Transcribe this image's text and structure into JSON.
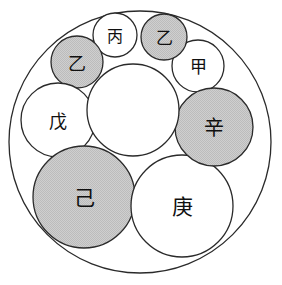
{
  "figure": {
    "kind": "circle-packing-diagram",
    "canvas": {
      "width": 282,
      "height": 285
    },
    "background_color": "#ffffff",
    "stroke_color": "#2a2a2a",
    "shaded_fill_color": "#c9c9c9",
    "unshaded_fill_color": "#ffffff",
    "stroke_width": 1.3
  },
  "outer_circle": {
    "name": "outer-boundary-circle",
    "cx": 140,
    "cy": 142,
    "r": 131,
    "fill": "#ffffff",
    "shaded": false,
    "label": ""
  },
  "central_circle": {
    "name": "central-circle",
    "cx": 133,
    "cy": 110,
    "r": 46,
    "fill": "#ffffff",
    "shaded": false,
    "label": ""
  },
  "chain_circles": [
    {
      "name": "circle-jia",
      "label": "甲",
      "romanization": "jia",
      "cx": 198,
      "cy": 66,
      "r": 26,
      "shaded": false,
      "fill": "#ffffff",
      "font_size": 17
    },
    {
      "name": "circle-yi-upper-right",
      "label": "乙",
      "romanization": "yi",
      "cx": 164,
      "cy": 37,
      "r": 23,
      "shaded": true,
      "fill": "#c9c9c9",
      "font_size": 17
    },
    {
      "name": "circle-bing",
      "label": "丙",
      "romanization": "bing",
      "cx": 115,
      "cy": 35,
      "r": 22,
      "shaded": false,
      "fill": "#ffffff",
      "font_size": 16
    },
    {
      "name": "circle-yi-upper-left",
      "label": "乙",
      "romanization": "yi",
      "cx": 77,
      "cy": 62,
      "r": 26,
      "shaded": true,
      "fill": "#c9c9c9",
      "font_size": 18
    },
    {
      "name": "circle-wu",
      "label": "戊",
      "romanization": "wu",
      "cx": 58,
      "cy": 120,
      "r": 37,
      "shaded": false,
      "fill": "#ffffff",
      "font_size": 18
    },
    {
      "name": "circle-ji",
      "label": "己",
      "romanization": "ji",
      "cx": 84,
      "cy": 197,
      "r": 51,
      "shaded": true,
      "fill": "#c9c9c9",
      "font_size": 21
    },
    {
      "name": "circle-geng",
      "label": "庚",
      "romanization": "geng",
      "cx": 182,
      "cy": 206,
      "r": 51,
      "shaded": false,
      "fill": "#ffffff",
      "font_size": 21
    },
    {
      "name": "circle-xin",
      "label": "辛",
      "romanization": "xin",
      "cx": 214,
      "cy": 127,
      "r": 39,
      "shaded": true,
      "fill": "#c9c9c9",
      "font_size": 20
    }
  ]
}
